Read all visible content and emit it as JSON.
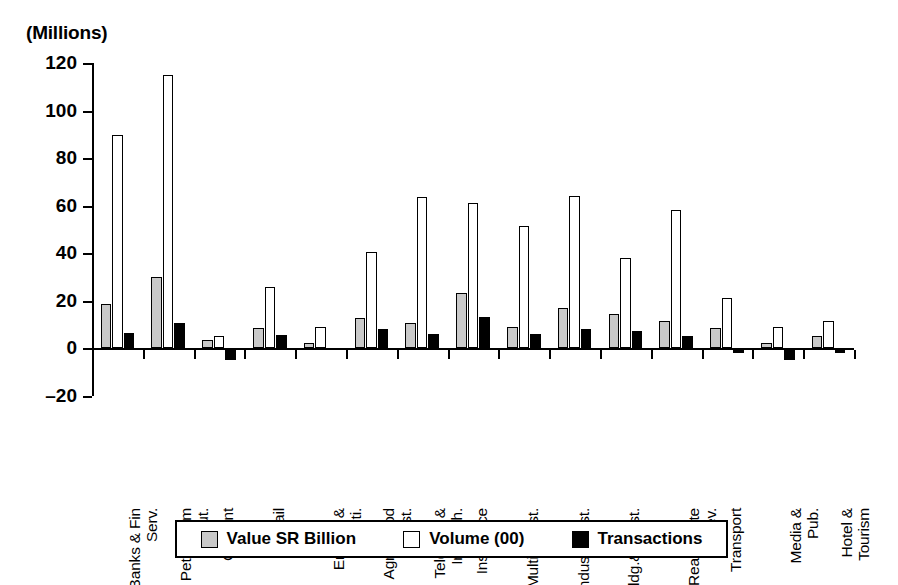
{
  "chart_data": {
    "type": "bar",
    "title": "",
    "units_label": "(Millions)",
    "xlabel": "",
    "ylabel": "",
    "ylim": [
      -20,
      120
    ],
    "yticks": [
      120,
      100,
      80,
      60,
      40,
      20,
      0,
      -20
    ],
    "grid": false,
    "legend_position": "bottom",
    "categories": [
      "Banks & Fin Serv.",
      "Petrochem Indsut.",
      "Cement",
      "Retail",
      "Energy & Uti.",
      "Agri&Food Indust.",
      "Telecom & Inf.Tech.",
      "Insurance",
      "Multi-invest.",
      "Indus.Invest.",
      "Bldg.&Const.",
      "Real Estate Dev.",
      "Transport",
      "Media & Pub.",
      "Hotel & Tourism"
    ],
    "category_lines": [
      [
        "Banks & Fin",
        "Serv."
      ],
      [
        "Petrochem",
        "Indsut."
      ],
      [
        "Cement"
      ],
      [
        "Retail"
      ],
      [
        "Energy &",
        "Uti."
      ],
      [
        "Agri&Food",
        "Indust."
      ],
      [
        "Telecom &",
        "Inf.Tech."
      ],
      [
        "Insurance"
      ],
      [
        "Multi-invest."
      ],
      [
        "Indus.Invest."
      ],
      [
        "Bldg.&Const."
      ],
      [
        "Real Estate",
        "Dev."
      ],
      [
        "Transport"
      ],
      [
        "Media &",
        "Pub."
      ],
      [
        "Hotel &",
        "Tourism"
      ]
    ],
    "series": [
      {
        "name": "Value SR Billion",
        "color": "#c9c9c9",
        "values": [
          18.5,
          30,
          3.5,
          8.5,
          2,
          12.5,
          10.5,
          23,
          9,
          17,
          14.5,
          11.5,
          8.5,
          2,
          5
        ]
      },
      {
        "name": "Volume (00)",
        "color": "#ffffff",
        "values": [
          89.5,
          115,
          5,
          25.5,
          9,
          40.5,
          63.5,
          61,
          51.5,
          64,
          38,
          58,
          21,
          9,
          11.5
        ]
      },
      {
        "name": "Transactions",
        "color": "#000000",
        "values": [
          6.5,
          10.5,
          -5,
          5.5,
          -0.5,
          8,
          6,
          13,
          6,
          8,
          7,
          5,
          -2,
          -5,
          -2
        ]
      }
    ]
  },
  "legend": {
    "items": [
      {
        "label": "Value SR Billion",
        "style": "value"
      },
      {
        "label": "Volume (00)",
        "style": "volume"
      },
      {
        "label": "Transactions",
        "style": "trans"
      }
    ]
  }
}
